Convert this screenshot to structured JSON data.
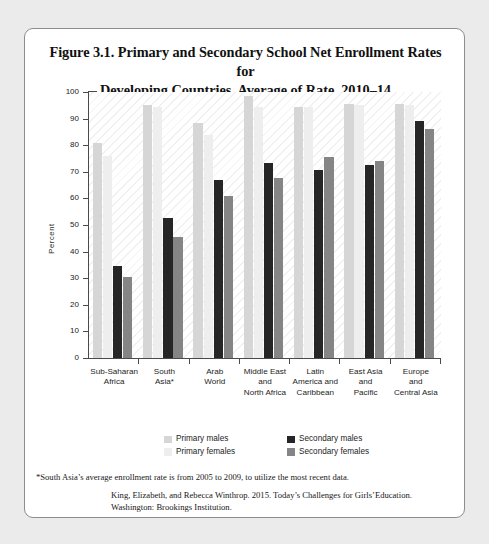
{
  "figure": {
    "title_line1": "Figure 3.1. Primary and Secondary School Net Enrollment Rates for",
    "title_line2": "Developing Countries, Average of Rate, 2010–14",
    "footnote": "*South Asia’s average enrollment rate is from 2005 to 2009, to utilize the most recent data.",
    "source_line1": "King, Elizabeth, and Rebecca Winthrop. 2015. Today’s Challenges for Girls’Education.",
    "source_line2": "Washington: Brookings Institution."
  },
  "colors": {
    "primary_males": "#d6d6d6",
    "primary_females": "#eeeeee",
    "secondary_males": "#262626",
    "secondary_females": "#858585",
    "axis": "#4a4a4a",
    "card_border": "#8d8d8d",
    "page_background": "#ebebeb",
    "card_background": "#ffffff"
  },
  "chart_data": {
    "type": "bar",
    "title": "Figure 3.1. Primary and Secondary School Net Enrollment Rates for Developing Countries, Average of Rate, 2010–14",
    "xlabel": "",
    "ylabel": "Percent",
    "ylim": [
      0,
      100
    ],
    "yticks": [
      0,
      10,
      20,
      30,
      40,
      50,
      60,
      70,
      80,
      90,
      100
    ],
    "ytick_labels": [
      "0",
      "10",
      "20",
      "30",
      "40",
      "50",
      "60",
      "70",
      "80",
      "90",
      "100"
    ],
    "grid": false,
    "legend_position": "bottom",
    "categories": [
      "Sub-Saharan Africa",
      "South Asia*",
      "Arab World",
      "Middle East and North Africa",
      "Latin America and Caribbean",
      "East Asia and Pacific",
      "Europe and Central Asia"
    ],
    "category_lines": [
      [
        "Sub-Saharan",
        "Africa"
      ],
      [
        "South",
        "Asia*"
      ],
      [
        "Arab",
        "World"
      ],
      [
        "Middle East",
        "and",
        "North Africa"
      ],
      [
        "Latin",
        "America and",
        "Caribbean"
      ],
      [
        "East Asia",
        "and",
        "Pacific"
      ],
      [
        "Europe",
        "and",
        "Central Asia"
      ]
    ],
    "series": [
      {
        "name": "Primary males",
        "color": "#d6d6d6",
        "values": [
          81,
          95,
          88.5,
          98.5,
          94.5,
          95.5,
          95.5
        ]
      },
      {
        "name": "Primary females",
        "color": "#eeeeee",
        "values": [
          76,
          94.5,
          84,
          94.5,
          94.5,
          95,
          95
        ]
      },
      {
        "name": "Secondary males",
        "color": "#262626",
        "values": [
          34.5,
          52.5,
          67,
          73.5,
          70.5,
          72.5,
          89
        ]
      },
      {
        "name": "Secondary females",
        "color": "#858585",
        "values": [
          30.5,
          45.5,
          61,
          67.5,
          75.5,
          74,
          86
        ]
      }
    ]
  },
  "legend": {
    "column1": [
      "Primary males",
      "Primary females"
    ],
    "column2": [
      "Secondary males",
      "Secondary females"
    ]
  }
}
